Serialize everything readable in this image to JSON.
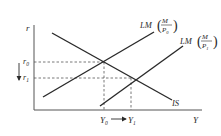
{
  "diagram": {
    "type": "IS-LM",
    "axes": {
      "y_label": "r",
      "x_label": "Y"
    },
    "curves": {
      "is": {
        "label": "IS"
      },
      "lm0": {
        "prefix": "LM",
        "num": "M",
        "den": "P",
        "den_sub": "0"
      },
      "lm1": {
        "prefix": "LM",
        "num": "M",
        "den": "P",
        "den_sub": "1"
      }
    },
    "levels": {
      "r0": {
        "base": "r",
        "sub": "0"
      },
      "r1": {
        "base": "r",
        "sub": "1"
      },
      "y0": {
        "base": "Y",
        "sub": "0"
      },
      "y1": {
        "base": "Y",
        "sub": "1"
      }
    },
    "colors": {
      "line": "#2a2a2a",
      "dashed": "#555555"
    }
  }
}
